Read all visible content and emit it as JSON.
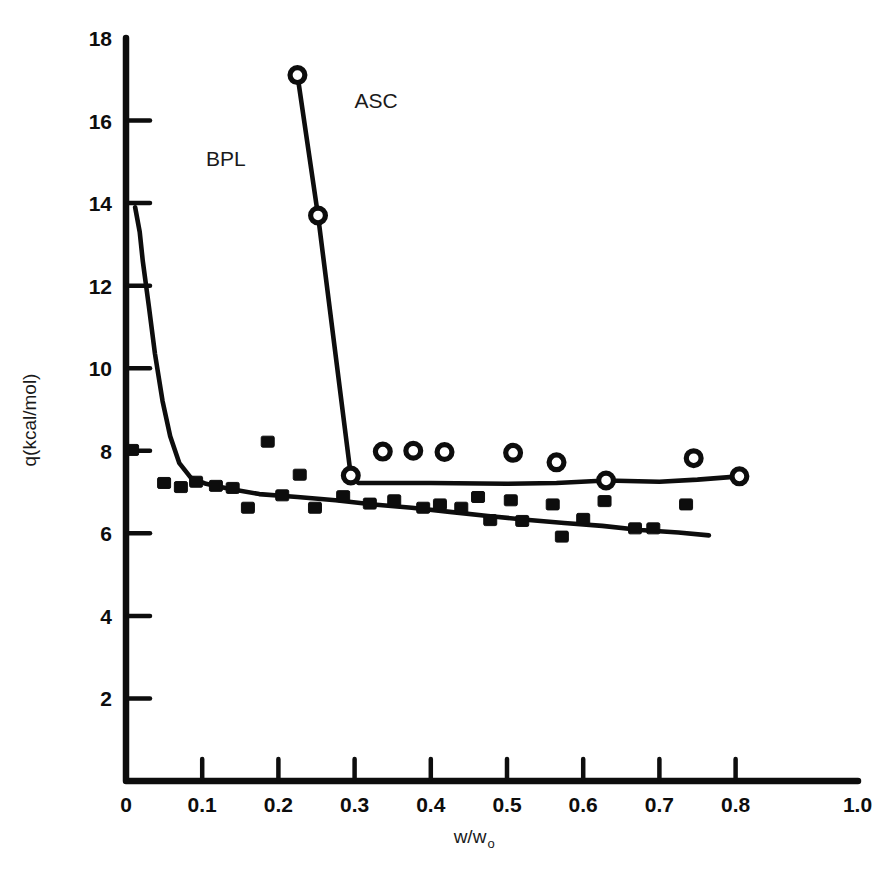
{
  "figure": {
    "background_color": "#ffffff",
    "ink_color": "#0d0d0d"
  },
  "chart_data": {
    "type": "line",
    "title": "",
    "xlabel": "w/w",
    "xlabel_subscript": "o",
    "ylabel": "q(kcal/mol)",
    "xlim": [
      0,
      1.0
    ],
    "ylim": [
      0,
      18
    ],
    "grid": false,
    "legend": "inline-annotations",
    "x_ticks": [
      {
        "value": 0,
        "label": "0",
        "has_mark": false
      },
      {
        "value": 0.1,
        "label": "0.1",
        "has_mark": true
      },
      {
        "value": 0.2,
        "label": "0.2",
        "has_mark": true
      },
      {
        "value": 0.3,
        "label": "0.3",
        "has_mark": true
      },
      {
        "value": 0.4,
        "label": "0.4",
        "has_mark": true
      },
      {
        "value": 0.5,
        "label": "0.5",
        "has_mark": true
      },
      {
        "value": 0.6,
        "label": "0.6",
        "has_mark": true
      },
      {
        "value": 0.7,
        "label": "0.7",
        "has_mark": true
      },
      {
        "value": 0.8,
        "label": "0.8",
        "has_mark": true
      },
      {
        "value": 0.96,
        "label": "1.0",
        "has_mark": false
      }
    ],
    "y_ticks": [
      {
        "value": 18,
        "label": "18",
        "has_mark": false
      },
      {
        "value": 16,
        "label": "16",
        "has_mark": true
      },
      {
        "value": 14,
        "label": "14",
        "has_mark": true
      },
      {
        "value": 12,
        "label": "12",
        "has_mark": true
      },
      {
        "value": 10,
        "label": "10",
        "has_mark": true
      },
      {
        "value": 8,
        "label": "8",
        "has_mark": true
      },
      {
        "value": 6,
        "label": "6",
        "has_mark": true
      },
      {
        "value": 4,
        "label": "4",
        "has_mark": true
      },
      {
        "value": 2,
        "label": "2",
        "has_mark": true
      },
      {
        "value": 0,
        "label": "0",
        "has_mark": false
      }
    ],
    "annotations": [
      {
        "text": "ASC",
        "x": 0.3,
        "y": 16.3
      },
      {
        "text": "BPL",
        "x": 0.105,
        "y": 14.9
      }
    ],
    "series": [
      {
        "name": "ASC",
        "marker": "open-circle",
        "line": [
          [
            0.225,
            17.1
          ],
          [
            0.252,
            13.7
          ],
          [
            0.295,
            7.4
          ],
          [
            0.305,
            7.22
          ],
          [
            0.4,
            7.22
          ],
          [
            0.5,
            7.2
          ],
          [
            0.565,
            7.22
          ],
          [
            0.63,
            7.28
          ],
          [
            0.7,
            7.25
          ],
          [
            0.75,
            7.3
          ],
          [
            0.805,
            7.38
          ]
        ],
        "points": [
          [
            0.225,
            17.1
          ],
          [
            0.252,
            13.7
          ],
          [
            0.295,
            7.4
          ],
          [
            0.337,
            7.98
          ],
          [
            0.377,
            8.0
          ],
          [
            0.418,
            7.97
          ],
          [
            0.508,
            7.95
          ],
          [
            0.565,
            7.72
          ],
          [
            0.63,
            7.28
          ],
          [
            0.745,
            7.82
          ],
          [
            0.805,
            7.38
          ]
        ]
      },
      {
        "name": "BPL",
        "marker": "filled-square",
        "line": [
          [
            0.012,
            13.9
          ],
          [
            0.018,
            13.3
          ],
          [
            0.022,
            12.6
          ],
          [
            0.03,
            11.5
          ],
          [
            0.038,
            10.35
          ],
          [
            0.048,
            9.2
          ],
          [
            0.058,
            8.35
          ],
          [
            0.07,
            7.7
          ],
          [
            0.085,
            7.35
          ],
          [
            0.105,
            7.2
          ],
          [
            0.135,
            7.08
          ],
          [
            0.175,
            6.95
          ],
          [
            0.225,
            6.88
          ],
          [
            0.275,
            6.8
          ],
          [
            0.325,
            6.7
          ],
          [
            0.375,
            6.62
          ],
          [
            0.425,
            6.52
          ],
          [
            0.475,
            6.42
          ],
          [
            0.525,
            6.33
          ],
          [
            0.575,
            6.25
          ],
          [
            0.625,
            6.18
          ],
          [
            0.675,
            6.08
          ],
          [
            0.725,
            6.02
          ],
          [
            0.765,
            5.95
          ]
        ],
        "points": [
          [
            0.008,
            8.02
          ],
          [
            0.05,
            7.22
          ],
          [
            0.072,
            7.12
          ],
          [
            0.092,
            7.25
          ],
          [
            0.118,
            7.15
          ],
          [
            0.14,
            7.1
          ],
          [
            0.16,
            6.62
          ],
          [
            0.186,
            8.22
          ],
          [
            0.205,
            6.92
          ],
          [
            0.228,
            7.42
          ],
          [
            0.248,
            6.62
          ],
          [
            0.285,
            6.9
          ],
          [
            0.32,
            6.72
          ],
          [
            0.352,
            6.8
          ],
          [
            0.39,
            6.62
          ],
          [
            0.412,
            6.7
          ],
          [
            0.44,
            6.62
          ],
          [
            0.462,
            6.88
          ],
          [
            0.478,
            6.32
          ],
          [
            0.505,
            6.8
          ],
          [
            0.52,
            6.3
          ],
          [
            0.56,
            6.7
          ],
          [
            0.572,
            5.92
          ],
          [
            0.6,
            6.35
          ],
          [
            0.628,
            6.78
          ],
          [
            0.668,
            6.12
          ],
          [
            0.692,
            6.12
          ],
          [
            0.735,
            6.7
          ]
        ]
      }
    ]
  }
}
